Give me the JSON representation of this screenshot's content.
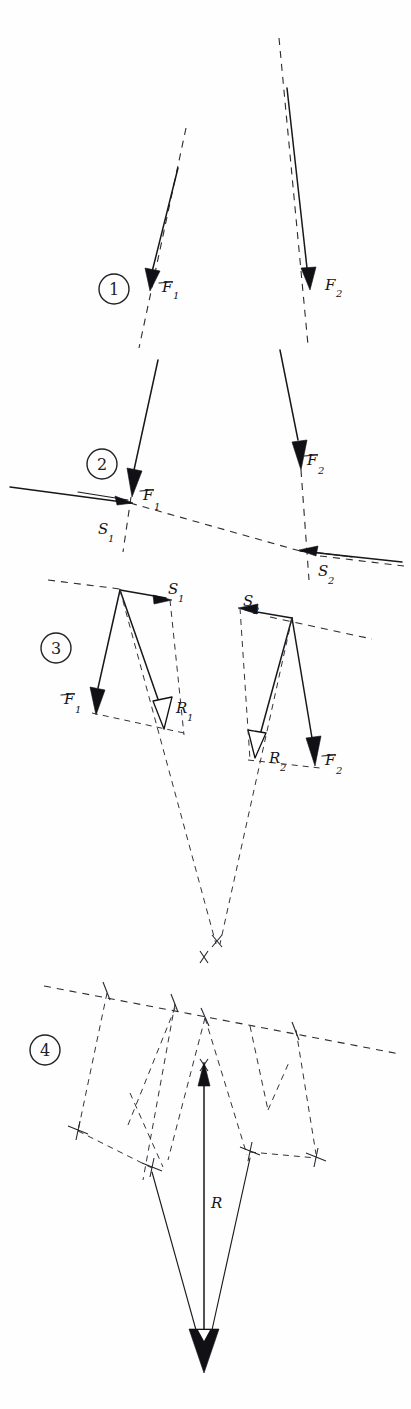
{
  "document": {
    "title": "Graphical composition of two parallel forces",
    "kind": "hand-drawn engineering mechanics construction",
    "width": 411,
    "height": 1409,
    "background_color": "#fefefe",
    "ink_color": "#17171c"
  },
  "steps": [
    {
      "id": "step-1",
      "number": "1",
      "circle": {
        "cx": 114,
        "cy": 289,
        "r": 15
      },
      "labels": [
        {
          "key": "f1",
          "base": "F",
          "sub": "1",
          "x": 162,
          "y": 292
        },
        {
          "key": "f2",
          "base": "F",
          "sub": "2",
          "x": 325,
          "y": 290
        }
      ]
    },
    {
      "id": "step-2",
      "number": "2",
      "circle": {
        "cx": 102,
        "cy": 464,
        "r": 15
      },
      "labels": [
        {
          "key": "f1",
          "base": "F",
          "sub": "1",
          "x": 143,
          "y": 500
        },
        {
          "key": "f2",
          "base": "F",
          "sub": "2",
          "x": 307,
          "y": 465
        },
        {
          "key": "s1",
          "base": "S",
          "sub": "1",
          "x": 98,
          "y": 534
        },
        {
          "key": "s2",
          "base": "S",
          "sub": "2",
          "x": 318,
          "y": 576
        }
      ]
    },
    {
      "id": "step-3",
      "number": "3",
      "circle": {
        "cx": 56,
        "cy": 648,
        "r": 15
      },
      "labels": [
        {
          "key": "s1",
          "base": "S",
          "sub": "1",
          "x": 173,
          "y": 594
        },
        {
          "key": "s2",
          "base": "S",
          "sub": "2",
          "x": 246,
          "y": 606
        },
        {
          "key": "f1",
          "base": "F",
          "sub": "1",
          "x": 66,
          "y": 704
        },
        {
          "key": "r1",
          "base": "R",
          "sub": "1",
          "x": 178,
          "y": 711
        },
        {
          "key": "r2",
          "base": "R",
          "sub": "2",
          "x": 271,
          "y": 761
        },
        {
          "key": "f2",
          "base": "F",
          "sub": "2",
          "x": 327,
          "y": 765
        }
      ]
    },
    {
      "id": "step-4",
      "number": "4",
      "circle": {
        "cx": 45,
        "cy": 1050,
        "r": 15
      },
      "labels": [
        {
          "key": "r",
          "base": "R",
          "sub": "",
          "x": 211,
          "y": 1208
        }
      ]
    }
  ],
  "vectors": {
    "F1": {
      "name": "F1",
      "symbol": "F",
      "subscript": "1",
      "style": "filled-arrow",
      "meaning": "first applied force"
    },
    "F2": {
      "name": "F2",
      "symbol": "F",
      "subscript": "2",
      "style": "filled-arrow",
      "meaning": "second applied force"
    },
    "S1": {
      "name": "S1",
      "symbol": "S",
      "subscript": "1",
      "style": "filled-arrow",
      "meaning": "first auxiliary force along the line of action"
    },
    "S2": {
      "name": "S2",
      "symbol": "S",
      "subscript": "2",
      "style": "filled-arrow",
      "meaning": "second auxiliary force along the line of action"
    },
    "R1": {
      "name": "R1",
      "symbol": "R",
      "subscript": "1",
      "style": "hollow-arrow",
      "meaning": "partial resultant of F1 and S1"
    },
    "R2": {
      "name": "R2",
      "symbol": "R",
      "subscript": "2",
      "style": "hollow-arrow",
      "meaning": "partial resultant of F2 and S2"
    },
    "R": {
      "name": "R",
      "symbol": "R",
      "subscript": "",
      "style": "filled-arrow",
      "meaning": "total resultant force"
    }
  },
  "legend_keys": {
    "F": "F",
    "S": "S",
    "R": "R",
    "one": "1",
    "two": "2"
  }
}
